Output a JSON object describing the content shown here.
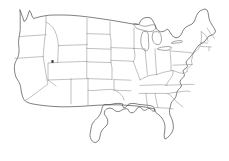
{
  "figure": {
    "type": "line-art-map",
    "region": "Contiguous United States (Lower 48)",
    "background_color": "#ffffff",
    "outline_color": "#4a4a4a",
    "state_border_color": "#8d8d8d",
    "lake_color": "#6b6b6b",
    "marker_color": "#333333",
    "width_px": 229,
    "height_px": 161,
    "has_labels": false,
    "has_legend": false,
    "has_title_text": false
  },
  "features": {
    "national_outline_label": "United States national outline",
    "state_borders_label": "State boundary lines",
    "great_lakes_label": "Great Lakes",
    "marker_label": "Location marker",
    "marker_position": {
      "x": 52,
      "y": 61
    }
  },
  "regions": [
    {
      "name": "West Coast",
      "detail": "California, Oregon, Washington coastline"
    },
    {
      "name": "Great Lakes",
      "detail": "Superior, Michigan, Huron, Erie, Ontario"
    },
    {
      "name": "Northeast",
      "detail": "New England and Maine"
    },
    {
      "name": "Mid-Atlantic",
      "detail": "Chesapeake Bay and Delmarva Peninsula"
    },
    {
      "name": "Southeast",
      "detail": "Florida peninsula and Gulf Coast"
    },
    {
      "name": "South Central",
      "detail": "Texas and Gulf of Mexico coastline"
    },
    {
      "name": "Great Plains",
      "detail": "Rectangular plains state boundaries"
    }
  ]
}
